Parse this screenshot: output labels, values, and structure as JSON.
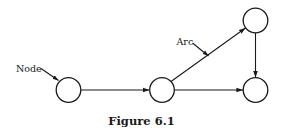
{
  "figure": {
    "caption": "Figure 6.1",
    "colors": {
      "ink": "#1a1a1a",
      "background": "#ffffff"
    }
  },
  "graph": {
    "nodes": [
      {
        "id": "n1",
        "name": "node-left"
      },
      {
        "id": "n2",
        "name": "node-middle"
      },
      {
        "id": "n3",
        "name": "node-top-right"
      },
      {
        "id": "n4",
        "name": "node-bottom-right"
      }
    ],
    "arcs": [
      {
        "from": "n1",
        "to": "n2",
        "directed": true
      },
      {
        "from": "n2",
        "to": "n3",
        "directed": true
      },
      {
        "from": "n2",
        "to": "n4",
        "directed": true
      },
      {
        "from": "n3",
        "to": "n4",
        "directed": true
      }
    ]
  },
  "annotations": {
    "node_label": "Node",
    "node_label_target": "n1",
    "arc_label": "Arc",
    "arc_label_target": "n2->n3"
  }
}
